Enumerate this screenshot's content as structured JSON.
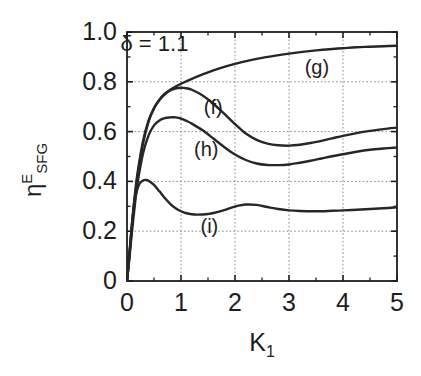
{
  "chart_data": {
    "type": "line",
    "title": "",
    "xlabel": "K",
    "xlabel_sub": "1",
    "ylabel_main": "η",
    "ylabel_sup": "E",
    "ylabel_sub": "SFG",
    "xlim": [
      0,
      5
    ],
    "ylim": [
      0,
      1.0
    ],
    "grid": true,
    "grid_style": "dotted",
    "legend_position": "inline-labels",
    "xticks": [
      "0",
      "1",
      "2",
      "3",
      "4",
      "5"
    ],
    "xtick_values": [
      0,
      1,
      2,
      3,
      4,
      5
    ],
    "yticks": [
      "0",
      "0.2",
      "0.4",
      "0.6",
      "0.8",
      "1.0"
    ],
    "ytick_values": [
      0,
      0.2,
      0.4,
      0.6,
      0.8,
      1.0
    ],
    "annotations": [
      {
        "text": "δ = 1.1",
        "x": 0.62,
        "y": 0.945,
        "name": "delta-annotation"
      }
    ],
    "series": [
      {
        "name": "(g)",
        "label_x": 3.55,
        "label_y": 0.855,
        "x": [
          0,
          0.05,
          0.1,
          0.15,
          0.2,
          0.3,
          0.4,
          0.5,
          0.6,
          0.7,
          0.8,
          0.9,
          1.0,
          1.2,
          1.4,
          1.6,
          1.8,
          2.0,
          2.25,
          2.5,
          2.75,
          3.0,
          3.25,
          3.5,
          3.75,
          4.0,
          4.25,
          4.5,
          4.75,
          5.0
        ],
        "y": [
          0,
          0.12,
          0.25,
          0.355,
          0.44,
          0.565,
          0.645,
          0.695,
          0.728,
          0.752,
          0.768,
          0.781,
          0.792,
          0.812,
          0.83,
          0.846,
          0.86,
          0.872,
          0.885,
          0.896,
          0.905,
          0.913,
          0.92,
          0.926,
          0.931,
          0.935,
          0.939,
          0.941,
          0.943,
          0.945
        ]
      },
      {
        "name": "(f)",
        "label_x": 1.68,
        "label_y": 0.695,
        "x": [
          0,
          0.05,
          0.1,
          0.15,
          0.2,
          0.3,
          0.4,
          0.5,
          0.6,
          0.7,
          0.8,
          0.9,
          1.0,
          1.05,
          1.1,
          1.2,
          1.4,
          1.6,
          1.8,
          2.0,
          2.2,
          2.4,
          2.6,
          2.8,
          3.0,
          3.2,
          3.4,
          3.6,
          3.8,
          4.0,
          4.25,
          4.5,
          4.75,
          5.0
        ],
        "y": [
          0,
          0.115,
          0.24,
          0.345,
          0.43,
          0.555,
          0.64,
          0.693,
          0.727,
          0.75,
          0.765,
          0.773,
          0.776,
          0.7755,
          0.774,
          0.768,
          0.745,
          0.712,
          0.672,
          0.63,
          0.592,
          0.567,
          0.552,
          0.545,
          0.5435,
          0.547,
          0.554,
          0.563,
          0.573,
          0.583,
          0.594,
          0.603,
          0.61,
          0.616
        ]
      },
      {
        "name": "(h)",
        "label_x": 1.5,
        "label_y": 0.525,
        "x": [
          0,
          0.05,
          0.1,
          0.15,
          0.2,
          0.3,
          0.4,
          0.5,
          0.6,
          0.7,
          0.8,
          0.85,
          0.9,
          1.0,
          1.1,
          1.2,
          1.4,
          1.6,
          1.8,
          2.0,
          2.2,
          2.4,
          2.6,
          2.8,
          3.0,
          3.2,
          3.4,
          3.6,
          3.8,
          4.0,
          4.25,
          4.5,
          4.75,
          5.0
        ],
        "y": [
          0,
          0.105,
          0.215,
          0.315,
          0.4,
          0.515,
          0.585,
          0.625,
          0.645,
          0.654,
          0.657,
          0.6575,
          0.657,
          0.652,
          0.643,
          0.632,
          0.605,
          0.572,
          0.538,
          0.508,
          0.486,
          0.472,
          0.466,
          0.4655,
          0.468,
          0.475,
          0.483,
          0.492,
          0.501,
          0.509,
          0.519,
          0.527,
          0.532,
          0.536
        ]
      },
      {
        "name": "(i)",
        "label_x": 1.62,
        "label_y": 0.215,
        "x": [
          0,
          0.05,
          0.1,
          0.15,
          0.2,
          0.25,
          0.3,
          0.35,
          0.4,
          0.5,
          0.6,
          0.7,
          0.8,
          0.9,
          1.0,
          1.1,
          1.2,
          1.3,
          1.4,
          1.5,
          1.6,
          1.8,
          2.0,
          2.1,
          2.2,
          2.4,
          2.6,
          2.8,
          3.0,
          3.2,
          3.5,
          3.8,
          4.0,
          4.25,
          4.5,
          4.75,
          5.0
        ],
        "y": [
          0,
          0.125,
          0.245,
          0.33,
          0.375,
          0.396,
          0.404,
          0.406,
          0.403,
          0.386,
          0.36,
          0.333,
          0.31,
          0.292,
          0.28,
          0.272,
          0.268,
          0.2665,
          0.267,
          0.269,
          0.273,
          0.285,
          0.299,
          0.304,
          0.307,
          0.3055,
          0.297,
          0.289,
          0.2835,
          0.281,
          0.28,
          0.282,
          0.2835,
          0.286,
          0.289,
          0.292,
          0.296
        ]
      }
    ],
    "colors": {
      "axis": "#1d1d1d",
      "curve": "#262626",
      "grid": "#8a8a8a",
      "background": "#ffffff"
    }
  },
  "geometry": {
    "plot_left": 127,
    "plot_top": 32,
    "plot_right": 397,
    "plot_bottom": 281
  }
}
